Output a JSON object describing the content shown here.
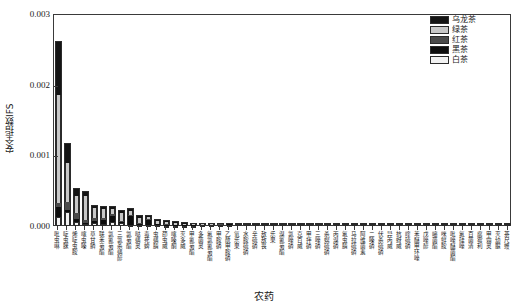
{
  "chart_data": {
    "type": "bar",
    "subtype": "stacked-bar",
    "title": "",
    "xlabel": "农药",
    "ylabel": "安全指数IFS",
    "ylim": [
      0,
      0.003
    ],
    "yticks": [
      0.0,
      0.001,
      0.002,
      0.003
    ],
    "ytick_labels": [
      "0.000",
      "0.001",
      "0.002",
      "0.003"
    ],
    "grid": false,
    "legend_position": "top-right",
    "legend": [
      "乌龙茶",
      "绿茶",
      "红茶",
      "黑茶",
      "白茶"
    ],
    "colors": {
      "乌龙茶": "#141414",
      "绿茶": "#c8c8c8",
      "红茶": "#4a4a4a",
      "黑茶": "#0d0d0d",
      "白茶": "#f2f2f2"
    },
    "categories": [
      "吡虫啉",
      "啶虫脒",
      "烯啶虫胺",
      "噻虫嗪",
      "草甘膦",
      "联苯菊酯",
      "氯氰菊酯",
      "三氯杀螨醇",
      "氯菊酯",
      "哒螨灵",
      "毒死蜱",
      "虫螨腈",
      "茚虫威",
      "噻嗪酮",
      "灭多威",
      "甲氰菊酯",
      "多菌灵",
      "氟氯氰菊酯",
      "甲胺磷",
      "乙酰甲胺磷",
      "氧乐果",
      "水胺硫磷",
      "辛硫磷",
      "敌敌畏",
      "乐果",
      "溴氰菊酯",
      "氯唑磷",
      "克百威",
      "甲拌磷",
      "三唑磷",
      "杀螟硫磷",
      "丙溴磷",
      "氟虫腈",
      "马拉硫磷",
      "阿维菌素",
      "二嗪磷",
      "伏杀硫磷",
      "异丙威",
      "抗蚜威",
      "喹硫磷",
      "苯醚甲环唑",
      "戊唑醇",
      "嘧菌酯",
      "咪鲜胺",
      "吡唑醚菌酯",
      "氟硅唑",
      "百菌清",
      "腐霉利",
      "甲霜灵",
      "灭幼脲",
      "茶尺蠖"
    ],
    "series": [
      {
        "name": "白茶",
        "values": [
          0.00013,
          0.000195,
          5.5e-05,
          2.5e-05,
          4.5e-05,
          3e-05,
          5e-05,
          4e-05,
          1.2e-05,
          1e-05,
          8e-06,
          1e-05,
          6e-06,
          5e-06,
          4e-06,
          3e-06,
          2e-06,
          1.8e-06,
          1.5e-06,
          1.2e-06,
          1e-06,
          9e-07,
          8e-07,
          7e-07,
          6e-07,
          5e-07,
          5e-07,
          4e-07,
          4e-07,
          3e-07,
          3e-07,
          3e-07,
          2e-07,
          2e-07,
          2e-07,
          2e-07,
          1e-07,
          1e-07,
          1e-07,
          1e-07,
          1e-07,
          1e-07,
          1e-07,
          1e-07,
          1e-07,
          1e-07,
          1e-07,
          1e-07,
          1e-07,
          1e-07,
          1e-07
        ]
      },
      {
        "name": "黑茶",
        "values": [
          0.000135,
          3.5e-05,
          5e-05,
          1.5e-05,
          2e-05,
          6e-05,
          9.5e-05,
          1.5e-05,
          0.00013,
          1.8e-05,
          7.5e-05,
          1.2e-05,
          1e-05,
          8e-06,
          6e-06,
          5e-06,
          3e-06,
          2.5e-06,
          2e-06,
          1.8e-06,
          1.5e-06,
          1.2e-06,
          1e-06,
          9e-07,
          8e-07,
          7e-07,
          6e-07,
          6e-07,
          5e-07,
          4e-07,
          4e-07,
          3e-07,
          3e-07,
          3e-07,
          2e-07,
          2e-07,
          2e-07,
          2e-07,
          1e-07,
          1e-07,
          1e-07,
          1e-07,
          1e-07,
          1e-07,
          1e-07,
          1e-07,
          1e-07,
          1e-07,
          1e-07,
          1e-07,
          1e-07
        ]
      },
      {
        "name": "红茶",
        "values": [
          6e-05,
          0.000115,
          8e-05,
          4.5e-05,
          5e-05,
          1.8e-05,
          2e-05,
          1.8e-05,
          1.5e-05,
          1.2e-05,
          1e-05,
          1e-05,
          8e-06,
          6e-06,
          5e-06,
          4e-06,
          2.5e-06,
          2.2e-06,
          1.8e-06,
          1.5e-06,
          1.2e-06,
          1e-06,
          9e-07,
          8e-07,
          7e-07,
          6e-07,
          5e-07,
          5e-07,
          4e-07,
          4e-07,
          3e-07,
          3e-07,
          2e-07,
          2e-07,
          2e-07,
          2e-07,
          1e-07,
          1e-07,
          1e-07,
          1e-07,
          1e-07,
          1e-07,
          1e-07,
          1e-07,
          1e-07,
          1e-07,
          1e-07,
          1e-07,
          1e-07,
          1e-07,
          1e-07
        ]
      },
      {
        "name": "绿茶",
        "values": [
          0.00153,
          0.000545,
          0.000245,
          0.00034,
          0.00014,
          0.00013,
          8e-05,
          0.000115,
          6e-05,
          8e-05,
          3e-05,
          4.5e-05,
          3.2e-05,
          2.5e-05,
          1.8e-05,
          1.2e-05,
          6e-06,
          5e-06,
          4e-06,
          3.5e-06,
          3e-06,
          2.5e-06,
          2e-06,
          1.8e-06,
          1.5e-06,
          1.2e-06,
          1e-06,
          9e-07,
          8e-07,
          7e-07,
          6e-07,
          5e-07,
          5e-07,
          4e-07,
          4e-07,
          3e-07,
          3e-07,
          2e-07,
          2e-07,
          2e-07,
          2e-07,
          1e-07,
          1e-07,
          1e-07,
          1e-07,
          1e-07,
          1e-07,
          1e-07,
          1e-07,
          1e-07,
          1e-07
        ]
      },
      {
        "name": "乌龙茶",
        "values": [
          0.000745,
          0.00027,
          0.0001,
          6e-05,
          3.5e-05,
          3e-05,
          2e-05,
          2.2e-05,
          1.8e-05,
          2e-05,
          1.2e-05,
          1.3e-05,
          9e-06,
          8e-06,
          6e-06,
          4e-06,
          3e-06,
          2.5e-06,
          2e-06,
          1.8e-06,
          1.5e-06,
          1.2e-06,
          1e-06,
          9e-07,
          8e-07,
          7e-07,
          6e-07,
          5e-07,
          4e-07,
          4e-07,
          3e-07,
          3e-07,
          2e-07,
          2e-07,
          2e-07,
          2e-07,
          1e-07,
          1e-07,
          1e-07,
          1e-07,
          1e-07,
          1e-07,
          1e-07,
          1e-07,
          1e-07,
          1e-07,
          1e-07,
          1e-07,
          1e-07,
          1e-07,
          1e-07
        ]
      }
    ],
    "totals": [
      0.0026,
      0.00116,
      0.00053,
      0.000485,
      0.00029,
      0.000268,
      0.000265,
      0.00021,
      0.000235,
      0.00014,
      0.000135,
      9e-05,
      6.5e-05,
      5.2e-05,
      3.9e-05,
      2.8e-05,
      1.65e-05,
      1.4e-05,
      1.13e-05,
      9.8e-06,
      8.2e-06,
      6.8e-06,
      5.7e-06,
      5.1e-06,
      4.4e-06,
      3.7e-06,
      3.2e-06,
      2.9e-06,
      2.5e-06,
      2.2e-06,
      1.9e-06,
      1.7e-06,
      1.4e-06,
      1.3e-06,
      1.2e-06,
      1.1e-06,
      8e-07,
      7e-07,
      6e-07,
      6e-07,
      6e-07,
      5e-07,
      5e-07,
      5e-07,
      5e-07,
      5e-07,
      4e-07,
      4e-07,
      4e-07,
      4e-07,
      4e-07
    ]
  }
}
